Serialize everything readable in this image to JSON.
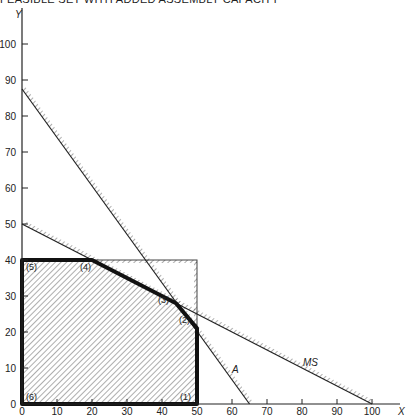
{
  "chart_data": {
    "type": "line",
    "title": "FEASIBLE SET WITH ADDED ASSEMBLY CAPACITY",
    "xlabel": "X",
    "ylabel": "Y",
    "xlim": [
      0,
      100
    ],
    "ylim": [
      0,
      100
    ],
    "x_ticks": [
      0,
      10,
      20,
      30,
      40,
      50,
      60,
      70,
      80,
      90,
      100
    ],
    "y_ticks": [
      0,
      10,
      20,
      30,
      40,
      50,
      60,
      70,
      80,
      90,
      100
    ],
    "grid": false,
    "constraints": [
      {
        "name": "A",
        "type": "line",
        "points": [
          [
            0,
            87.5
          ],
          [
            65,
            0
          ]
        ]
      },
      {
        "name": "MS",
        "type": "line",
        "points": [
          [
            0,
            50
          ],
          [
            100,
            0
          ]
        ]
      },
      {
        "name": "X limit",
        "type": "line",
        "points": [
          [
            50,
            0
          ],
          [
            50,
            40
          ]
        ]
      },
      {
        "name": "Y limit",
        "type": "line",
        "points": [
          [
            0,
            40
          ],
          [
            50,
            40
          ]
        ]
      }
    ],
    "feasible_region": {
      "vertices": [
        {
          "label": "(1)",
          "x": 50,
          "y": 0
        },
        {
          "label": "(2)",
          "x": 50,
          "y": 21
        },
        {
          "label": "(3)",
          "x": 44,
          "y": 28
        },
        {
          "label": "(4)",
          "x": 20,
          "y": 40
        },
        {
          "label": "(5)",
          "x": 0,
          "y": 40
        },
        {
          "label": "(6)",
          "x": 0,
          "y": 0
        }
      ]
    },
    "annotations": [
      "A",
      "MS"
    ]
  }
}
